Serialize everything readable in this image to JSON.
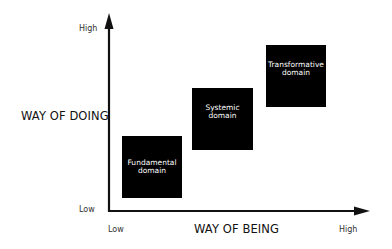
{
  "diagram": {
    "y_axis": {
      "title": "WAY OF DOING",
      "high_label": "High",
      "low_label": "Low"
    },
    "x_axis": {
      "title": "WAY OF BEING",
      "low_label": "Low",
      "high_label": "High"
    },
    "boxes": [
      {
        "line1": "Fundamental",
        "line2": "domain"
      },
      {
        "line1": "Systemic",
        "line2": "domain"
      },
      {
        "line1": "Transformative",
        "line2": "domain"
      }
    ],
    "colors": {
      "box_fill": "#000000",
      "box_text": "#ffffff",
      "axis": "#111111",
      "background": "#ffffff"
    }
  }
}
